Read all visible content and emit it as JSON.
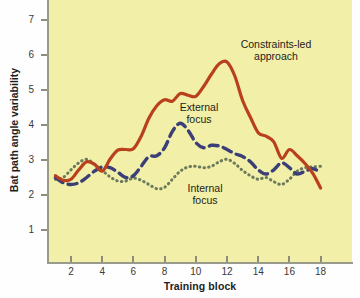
{
  "chart_data": {
    "type": "line",
    "title": "",
    "xlabel": "Training block",
    "ylabel": "Bat path angle variability",
    "xlim": [
      1,
      18
    ],
    "ylim": [
      0.4,
      7.4
    ],
    "xticks": [
      2,
      4,
      6,
      8,
      10,
      12,
      14,
      16,
      18
    ],
    "yticks": [
      1,
      2,
      3,
      4,
      5,
      6,
      7
    ],
    "grid": false,
    "legend_position": "inline-annotations",
    "background_color": "#f2efa8",
    "x": [
      1,
      1.5,
      2,
      2.5,
      3,
      3.5,
      4,
      4.5,
      5,
      5.5,
      6,
      6.5,
      7,
      7.5,
      8,
      8.5,
      9,
      9.5,
      10,
      10.5,
      11,
      11.5,
      12,
      12.5,
      13,
      13.5,
      14,
      14.5,
      15,
      15.5,
      16,
      16.5,
      17,
      17.5,
      18
    ],
    "series": [
      {
        "name": "Constraints-led approach",
        "color": "#b9401c",
        "style": "solid",
        "values": [
          2.55,
          2.42,
          2.45,
          2.72,
          2.95,
          2.88,
          2.68,
          3.02,
          3.28,
          3.3,
          3.32,
          3.68,
          4.2,
          4.55,
          4.72,
          4.68,
          4.9,
          4.85,
          4.82,
          5.1,
          5.45,
          5.75,
          5.8,
          5.4,
          4.7,
          4.22,
          3.78,
          3.68,
          3.52,
          3.05,
          3.3,
          3.12,
          2.9,
          2.62,
          2.2
        ]
      },
      {
        "name": "External focus",
        "color": "#3b3f78",
        "style": "dashed",
        "values": [
          2.5,
          2.35,
          2.3,
          2.35,
          2.5,
          2.68,
          2.8,
          2.78,
          2.65,
          2.5,
          2.55,
          2.82,
          3.1,
          3.12,
          3.35,
          3.82,
          4.05,
          3.85,
          3.5,
          3.35,
          3.42,
          3.4,
          3.3,
          3.18,
          3.1,
          2.95,
          2.72,
          2.6,
          2.72,
          2.92,
          2.78,
          2.6,
          2.68,
          2.75,
          2.65
        ]
      },
      {
        "name": "Internal focus",
        "color": "#6b7a5a",
        "style": "dotted",
        "values": [
          2.45,
          2.5,
          2.72,
          2.92,
          3.02,
          2.88,
          2.7,
          2.52,
          2.4,
          2.4,
          2.48,
          2.42,
          2.3,
          2.18,
          2.22,
          2.45,
          2.68,
          2.8,
          2.82,
          2.78,
          2.82,
          2.95,
          3.02,
          2.9,
          2.7,
          2.55,
          2.45,
          2.5,
          2.38,
          2.3,
          2.45,
          2.68,
          2.78,
          2.8,
          2.82
        ]
      }
    ],
    "annotations": [
      {
        "name": "constraints-led-label",
        "text": "Constraints-led approach",
        "lines": [
          "Constraints-led",
          "approach"
        ]
      },
      {
        "name": "external-focus-label",
        "text": "External focus",
        "lines": [
          "External",
          "focus"
        ]
      },
      {
        "name": "internal-focus-label",
        "text": "Internal focus",
        "lines": [
          "Internal",
          "focus"
        ]
      }
    ]
  },
  "axes": {
    "x_title": "Training block",
    "y_title": "Bat path angle variability",
    "x_tick_labels": [
      "2",
      "4",
      "6",
      "8",
      "10",
      "12",
      "14",
      "16",
      "18"
    ],
    "y_tick_labels": [
      "7",
      "6",
      "5",
      "4",
      "3",
      "2",
      "1"
    ]
  },
  "labels": {
    "constraints_line1": "Constraints-led",
    "constraints_line2": "approach",
    "external_line1": "External",
    "external_line2": "focus",
    "internal_line1": "Internal",
    "internal_line2": "focus"
  }
}
